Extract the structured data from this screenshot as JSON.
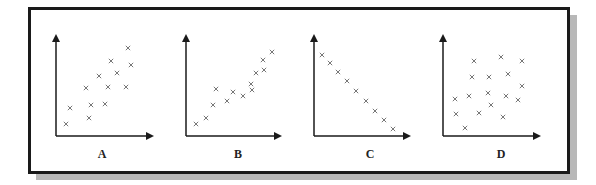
{
  "figure": {
    "panels": [
      {
        "label": "A",
        "description": "moderate positive correlation"
      },
      {
        "label": "B",
        "description": "strong positive correlation"
      },
      {
        "label": "C",
        "description": "perfect negative correlation"
      },
      {
        "label": "D",
        "description": "no correlation"
      }
    ],
    "marker": "×",
    "colors": {
      "axis": "#1a1a1a",
      "marker": "#777777",
      "frame": "#1a1a1a",
      "shadow": "#b8b8b8"
    }
  },
  "chart_data": [
    {
      "type": "scatter",
      "title": "A",
      "xlabel": "",
      "ylabel": "",
      "grid": false,
      "points": [
        [
          66,
          124
        ],
        [
          70,
          108
        ],
        [
          86,
          88
        ],
        [
          89,
          118
        ],
        [
          91,
          105
        ],
        [
          99,
          76
        ],
        [
          105,
          104
        ],
        [
          108,
          87
        ],
        [
          111,
          61
        ],
        [
          117,
          73
        ],
        [
          126,
          87
        ],
        [
          128,
          48
        ],
        [
          131,
          65
        ]
      ],
      "axes": {
        "origin": [
          56,
          136
        ],
        "x_end": 158,
        "y_end": 30
      }
    },
    {
      "type": "scatter",
      "title": "B",
      "xlabel": "",
      "ylabel": "",
      "grid": false,
      "points": [
        [
          196,
          124
        ],
        [
          206,
          118
        ],
        [
          213,
          105
        ],
        [
          216,
          89
        ],
        [
          227,
          101
        ],
        [
          233,
          92
        ],
        [
          243,
          96
        ],
        [
          251,
          84
        ],
        [
          252,
          90
        ],
        [
          256,
          73
        ],
        [
          264,
          70
        ],
        [
          263,
          60
        ],
        [
          272,
          52
        ]
      ],
      "axes": {
        "origin": [
          186,
          136
        ],
        "x_end": 286,
        "y_end": 30
      }
    },
    {
      "type": "scatter",
      "title": "C",
      "xlabel": "",
      "ylabel": "",
      "grid": false,
      "points": [
        [
          322,
          55
        ],
        [
          330,
          63
        ],
        [
          338,
          72
        ],
        [
          347,
          81
        ],
        [
          356,
          91
        ],
        [
          366,
          101
        ],
        [
          375,
          111
        ],
        [
          384,
          120
        ],
        [
          393,
          129
        ]
      ],
      "axes": {
        "origin": [
          314,
          136
        ],
        "x_end": 415,
        "y_end": 30
      }
    },
    {
      "type": "scatter",
      "title": "D",
      "xlabel": "",
      "ylabel": "",
      "grid": false,
      "points": [
        [
          474,
          61
        ],
        [
          501,
          57
        ],
        [
          522,
          61
        ],
        [
          472,
          77
        ],
        [
          489,
          77
        ],
        [
          508,
          74
        ],
        [
          522,
          86
        ],
        [
          455,
          99
        ],
        [
          469,
          96
        ],
        [
          488,
          93
        ],
        [
          506,
          96
        ],
        [
          518,
          100
        ],
        [
          491,
          105
        ],
        [
          456,
          114
        ],
        [
          479,
          113
        ],
        [
          503,
          117
        ],
        [
          465,
          128
        ]
      ],
      "axes": {
        "origin": [
          443,
          136
        ],
        "x_end": 545,
        "y_end": 30
      }
    }
  ]
}
